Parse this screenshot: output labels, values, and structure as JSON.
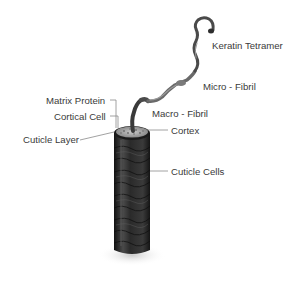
{
  "diagram": {
    "labels": {
      "keratin_tetramer": "Keratin Tetramer",
      "micro_fibril": "Micro - Fibril",
      "macro_fibril": "Macro - Fibril",
      "matrix_protein": "Matrix Protein",
      "cortical_cell": "Cortical Cell",
      "cortex": "Cortex",
      "cuticle_layer": "Cuticle Layer",
      "cuticle_cells": "Cuticle Cells"
    },
    "colors": {
      "background": "#ffffff",
      "text": "#3a3a3a",
      "leader": "#7a7a7a",
      "shaft_dark": "#1e1e1e",
      "shaft_mid": "#3c3c3c",
      "fibril": "#555555",
      "cross_section": "#a8a8a8"
    }
  }
}
